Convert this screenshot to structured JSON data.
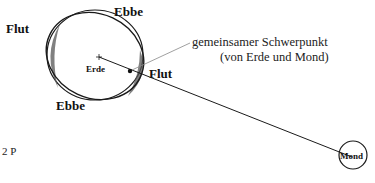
{
  "diagram": {
    "labels": {
      "flut_left": "Flut",
      "ebbe_top": "Ebbe",
      "flut_right": "Flut",
      "ebbe_bottom": "Ebbe",
      "erde": "Erde",
      "mond": "Mond",
      "schwerpunkt_line1": "gemeinsamer Schwerpunkt",
      "schwerpunkt_line2": "(von Erde und Mond)",
      "page_marker": "2 P"
    },
    "colors": {
      "stroke": "#1a1a1a",
      "leader": "#888888",
      "tide_shade": "#555555",
      "background": "#ffffff"
    }
  }
}
